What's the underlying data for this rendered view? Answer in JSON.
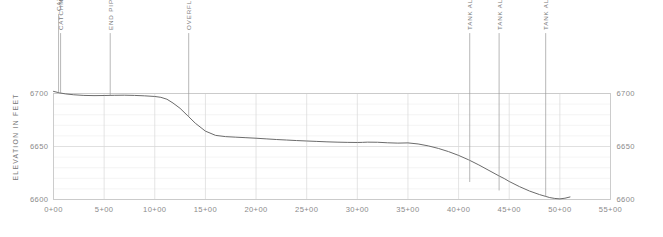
{
  "chart_data": {
    "type": "line",
    "title": "",
    "xlabel": "",
    "ylabel": "ELEVATION IN FEET",
    "xlim": [
      0,
      5500
    ],
    "ylim": [
      6600,
      6700
    ],
    "grid": true,
    "grid_major_y": 50,
    "grid_minor_y": 10,
    "legend": "none",
    "x_tick_labels": [
      "0+00",
      "5+00",
      "10+00",
      "15+00",
      "20+00",
      "25+00",
      "30+00",
      "35+00",
      "40+00",
      "45+00",
      "50+00",
      "55+00"
    ],
    "x_tick_values": [
      0,
      500,
      1000,
      1500,
      2000,
      2500,
      3000,
      3500,
      4000,
      4500,
      5000,
      5500
    ],
    "y_tick_labels": [
      "6700",
      "6650",
      "6600"
    ],
    "y_tick_values": [
      6700,
      6650,
      6600
    ],
    "series": [
      {
        "name": "ground-profile",
        "x": [
          0,
          60,
          120,
          200,
          300,
          400,
          500,
          600,
          700,
          800,
          900,
          1000,
          1060,
          1120,
          1180,
          1250,
          1320,
          1400,
          1500,
          1600,
          1700,
          1800,
          1900,
          2000,
          2100,
          2200,
          2300,
          2400,
          2500,
          2600,
          2700,
          2800,
          2900,
          3000,
          3050,
          3100,
          3200,
          3300,
          3400,
          3500,
          3600,
          3700,
          3800,
          3900,
          4000,
          4100,
          4200,
          4300,
          4400,
          4450,
          4500,
          4600,
          4700,
          4800,
          4900,
          4950,
          5000,
          5050,
          5100
        ],
        "y": [
          6702.0,
          6700.6,
          6699.6,
          6698.8,
          6698.2,
          6698.0,
          6698.1,
          6698.3,
          6698.4,
          6698.2,
          6697.8,
          6697.2,
          6696.4,
          6694.6,
          6691.0,
          6686.0,
          6679.5,
          6672.0,
          6664.5,
          6660.5,
          6659.3,
          6658.8,
          6658.3,
          6657.8,
          6657.2,
          6656.6,
          6656.1,
          6655.6,
          6655.2,
          6654.8,
          6654.4,
          6654.1,
          6653.9,
          6653.8,
          6653.9,
          6654.1,
          6654.0,
          6653.5,
          6653.2,
          6653.4,
          6652.4,
          6650.6,
          6648.2,
          6645.2,
          6641.6,
          6637.4,
          6632.6,
          6627.4,
          6622.2,
          6619.8,
          6617.0,
          6612.2,
          6608.0,
          6604.6,
          6601.8,
          6601.0,
          6600.6,
          6601.2,
          6602.4
        ]
      }
    ],
    "annotations": [
      {
        "label": "CATCHMENT INVERT",
        "station": 50,
        "elevation": 6700.8,
        "leader_top": 6775
      },
      {
        "label": "CATCHMENT",
        "station": 70,
        "elevation": 6700.2,
        "leader_top": 6757
      },
      {
        "label": "END PIPE",
        "station": 560,
        "elevation": 6698.2,
        "leader_top": 6757
      },
      {
        "label": "OVERFLOW",
        "station": 1335,
        "elevation": 6678.0,
        "leader_top": 6757
      },
      {
        "label": "TANK ALT 1",
        "station": 4110,
        "elevation": 6616.5,
        "leader_top": 6757
      },
      {
        "label": "TANK ALT 2",
        "station": 4400,
        "elevation": 6608.5,
        "leader_top": 6757
      },
      {
        "label": "TANK ALT 3",
        "station": 4860,
        "elevation": 6602.4,
        "leader_top": 6757
      }
    ]
  },
  "axes": {
    "y_title": "ELEVATION IN FEET",
    "y_left_labels": [
      "6700",
      "6650",
      "6600"
    ],
    "y_right_labels": [
      "6700",
      "6650",
      "6600"
    ]
  },
  "colors": {
    "profile_line": "#6b6b6b",
    "grid_major": "#d8d8d8",
    "grid_minor": "#ececec",
    "frame": "#c9c9c9",
    "leader": "#9a9a9a",
    "text": "#7a7a7a"
  },
  "caption": {
    "text": ""
  }
}
